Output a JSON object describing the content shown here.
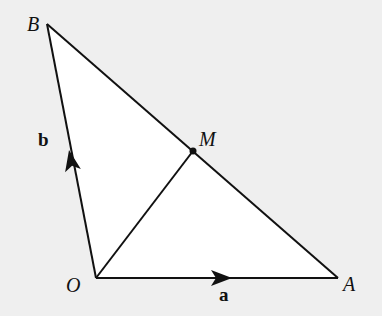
{
  "diagram": {
    "type": "vector-triangle",
    "points": {
      "O": {
        "label": "O",
        "x": 96,
        "y": 278
      },
      "A": {
        "label": "A",
        "x": 338,
        "y": 278
      },
      "B": {
        "label": "B",
        "x": 47,
        "y": 24
      },
      "M": {
        "label": "M",
        "x": 193,
        "y": 151
      }
    },
    "vectors": {
      "a": {
        "label": "a",
        "from": "O",
        "to": "A"
      },
      "b": {
        "label": "b",
        "from": "O",
        "to": "B"
      }
    },
    "segments": [
      "OA",
      "OB",
      "AB",
      "OM"
    ]
  },
  "colors": {
    "background": "#efefef",
    "triangle_fill": "#ffffff",
    "stroke": "#111111"
  }
}
